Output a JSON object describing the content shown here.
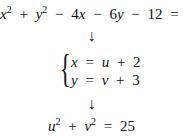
{
  "equation_original": {
    "x": "x",
    "x_exp": "2",
    "plus1": "+",
    "y": "y",
    "y_exp": "2",
    "minus1": "−",
    "term3": "4",
    "term3_var": "x",
    "minus2": "−",
    "term4": "6",
    "term4_var": "y",
    "minus3": "−",
    "const": "12",
    "eq": "=",
    "rhs": "0"
  },
  "arrow1": "↓",
  "substitution": {
    "row1": {
      "lhs": "x",
      "eq": "=",
      "var": "u",
      "op": "+",
      "num": "2"
    },
    "row2": {
      "lhs": "y",
      "eq": "=",
      "var": "v",
      "op": "+",
      "num": "3"
    },
    "brace": "{"
  },
  "arrow2": "↓",
  "equation_result": {
    "u": "u",
    "u_exp": "2",
    "plus": "+",
    "v": "v",
    "v_exp": "2",
    "eq": "=",
    "rhs": "25"
  }
}
